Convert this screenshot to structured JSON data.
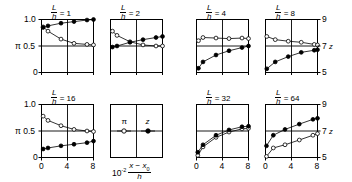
{
  "figure": {
    "axis": {
      "y_left_label": "π",
      "y_left_ticks": [
        "1.0",
        "0.5",
        "0"
      ],
      "y_right_label": "z",
      "y_right_ticks": [
        "9",
        "7",
        "5"
      ],
      "x_ticks": [
        "0",
        "4",
        "8"
      ],
      "x_label_prefix": "10",
      "x_label_exponent": "-2",
      "x_label_num": "x − x",
      "x_label_num_sub": "0",
      "x_label_den": "h"
    },
    "legend": {
      "title_ratio_num": "L",
      "title_ratio_den": "h",
      "entries": [
        {
          "symbol": "π",
          "marker": "open-circle"
        },
        {
          "symbol": "z",
          "marker": "filled-circle"
        }
      ]
    },
    "panels": [
      {
        "id": "panel-lh-1",
        "title_num": "L",
        "title_den": "h",
        "title_value": "1",
        "row": 0,
        "col": 0,
        "y_axis_side": "left",
        "series": [
          {
            "name": "π",
            "marker": "open-circle",
            "x": [
              0.25,
              1.0,
              3.0,
              5.0,
              7.0,
              8.0
            ],
            "y": [
              0.86,
              0.78,
              0.63,
              0.55,
              0.53,
              0.52
            ]
          },
          {
            "name": "z",
            "marker": "filled-circle",
            "x": [
              0.25,
              1.0,
              3.0,
              5.0,
              7.0,
              8.0
            ],
            "y": [
              0.85,
              0.88,
              0.93,
              0.96,
              0.99,
              1.0
            ]
          }
        ]
      },
      {
        "id": "panel-lh-2",
        "title_num": "L",
        "title_den": "h",
        "title_value": "2",
        "row": 0,
        "col": 1,
        "y_axis_side": "none",
        "series": [
          {
            "name": "π",
            "marker": "open-circle",
            "x": [
              0.3,
              1.0,
              3.0,
              5.0,
              7.0,
              8.0
            ],
            "y": [
              0.78,
              0.7,
              0.58,
              0.52,
              0.5,
              0.5
            ]
          },
          {
            "name": "z",
            "marker": "filled-circle",
            "x": [
              0.3,
              1.0,
              3.0,
              5.0,
              7.0,
              8.0
            ],
            "y": [
              0.48,
              0.5,
              0.57,
              0.62,
              0.66,
              0.68
            ]
          }
        ]
      },
      {
        "id": "panel-lh-4",
        "title_num": "L",
        "title_den": "h",
        "title_value": "4",
        "row": 0,
        "col": 2,
        "y_axis_side": "none",
        "series": [
          {
            "name": "π",
            "marker": "open-circle",
            "x": [
              0.3,
              1.0,
              3.0,
              5.0,
              7.0,
              8.0
            ],
            "y": [
              0.6,
              0.66,
              0.65,
              0.64,
              0.65,
              0.64
            ]
          },
          {
            "name": "z",
            "marker": "filled-circle",
            "x": [
              0.3,
              1.0,
              3.0,
              5.0,
              7.0,
              8.0
            ],
            "y": [
              0.08,
              0.2,
              0.33,
              0.41,
              0.47,
              0.5
            ]
          }
        ]
      },
      {
        "id": "panel-lh-8",
        "title_num": "L",
        "title_den": "h",
        "title_value": "8",
        "row": 0,
        "col": 3,
        "y_axis_side": "right",
        "series": [
          {
            "name": "π",
            "marker": "open-circle",
            "x": [
              0.2,
              1.5,
              3.5,
              5.5,
              7.5,
              8.0
            ],
            "y": [
              0.68,
              0.62,
              0.59,
              0.57,
              0.53,
              0.52
            ]
          },
          {
            "name": "z",
            "marker": "filled-circle",
            "x": [
              0.2,
              1.5,
              3.5,
              5.5,
              7.5,
              8.0
            ],
            "y": [
              0.07,
              0.2,
              0.3,
              0.38,
              0.42,
              0.43
            ]
          }
        ]
      },
      {
        "id": "panel-lh-16",
        "title_num": "L",
        "title_den": "h",
        "title_value": "16",
        "row": 1,
        "col": 0,
        "y_axis_side": "left",
        "series": [
          {
            "name": "π",
            "marker": "open-circle",
            "x": [
              0.25,
              1.0,
              3.0,
              5.0,
              7.0,
              8.0
            ],
            "y": [
              0.78,
              0.7,
              0.6,
              0.53,
              0.5,
              0.49
            ]
          },
          {
            "name": "z",
            "marker": "filled-circle",
            "x": [
              0.25,
              1.0,
              3.0,
              5.0,
              7.0,
              8.0
            ],
            "y": [
              0.16,
              0.18,
              0.22,
              0.25,
              0.28,
              0.31
            ]
          }
        ]
      },
      {
        "id": "panel-legend",
        "title_num": "",
        "title_den": "",
        "title_value": "",
        "row": 1,
        "col": 1,
        "y_axis_side": "none",
        "series": []
      },
      {
        "id": "panel-lh-32",
        "title_num": "L",
        "title_den": "h",
        "title_value": "32",
        "row": 1,
        "col": 2,
        "y_axis_side": "none",
        "series": [
          {
            "name": "π",
            "marker": "open-circle",
            "x": [
              0.2,
              1.0,
              3.0,
              5.0,
              7.0,
              8.0
            ],
            "y": [
              0.04,
              0.2,
              0.38,
              0.48,
              0.54,
              0.55
            ]
          },
          {
            "name": "z",
            "marker": "filled-circle",
            "x": [
              0.2,
              1.0,
              3.0,
              5.0,
              7.0,
              8.0
            ],
            "y": [
              0.1,
              0.24,
              0.42,
              0.52,
              0.58,
              0.59
            ]
          }
        ]
      },
      {
        "id": "panel-lh-64",
        "title_num": "L",
        "title_den": "h",
        "title_value": "64",
        "row": 1,
        "col": 3,
        "y_axis_side": "right",
        "series": [
          {
            "name": "π",
            "marker": "open-circle",
            "x": [
              0.15,
              1.2,
              3.0,
              5.2,
              7.3,
              8.0
            ],
            "y": [
              0.02,
              0.18,
              0.24,
              0.33,
              0.42,
              0.45
            ]
          },
          {
            "name": "z",
            "marker": "filled-circle",
            "x": [
              0.15,
              1.2,
              3.0,
              5.2,
              7.3,
              8.0
            ],
            "y": [
              0.22,
              0.42,
              0.53,
              0.63,
              0.72,
              0.74
            ]
          }
        ]
      }
    ]
  },
  "chart_data": {
    "type": "line",
    "title": "",
    "xlabel": "10^-2 (x - x0)/h",
    "ylabel_left": "π",
    "ylabel_right": "z",
    "xlim": [
      0,
      8
    ],
    "ylim_left": [
      0,
      1.0
    ],
    "ylim_right": [
      5,
      9
    ],
    "xticks": [
      0,
      4,
      8
    ],
    "yticks_left": [
      0,
      0.5,
      1.0
    ],
    "yticks_right": [
      5,
      7,
      9
    ],
    "grid": true,
    "legend": [
      "π",
      "z"
    ],
    "panels": [
      {
        "label": "L/h = 1",
        "series": [
          {
            "name": "π",
            "x": [
              0.25,
              1,
              3,
              5,
              7,
              8
            ],
            "y": [
              0.86,
              0.78,
              0.63,
              0.55,
              0.53,
              0.52
            ]
          },
          {
            "name": "z",
            "x": [
              0.25,
              1,
              3,
              5,
              7,
              8
            ],
            "y": [
              0.85,
              0.88,
              0.93,
              0.96,
              0.99,
              1.0
            ]
          }
        ]
      },
      {
        "label": "L/h = 2",
        "series": [
          {
            "name": "π",
            "x": [
              0.3,
              1,
              3,
              5,
              7,
              8
            ],
            "y": [
              0.78,
              0.7,
              0.58,
              0.52,
              0.5,
              0.5
            ]
          },
          {
            "name": "z",
            "x": [
              0.3,
              1,
              3,
              5,
              7,
              8
            ],
            "y": [
              0.48,
              0.5,
              0.57,
              0.62,
              0.66,
              0.68
            ]
          }
        ]
      },
      {
        "label": "L/h = 4",
        "series": [
          {
            "name": "π",
            "x": [
              0.3,
              1,
              3,
              5,
              7,
              8
            ],
            "y": [
              0.6,
              0.66,
              0.65,
              0.64,
              0.65,
              0.64
            ]
          },
          {
            "name": "z",
            "x": [
              0.3,
              1,
              3,
              5,
              7,
              8
            ],
            "y": [
              0.08,
              0.2,
              0.33,
              0.41,
              0.47,
              0.5
            ]
          }
        ]
      },
      {
        "label": "L/h = 8",
        "series": [
          {
            "name": "π",
            "x": [
              0.2,
              1.5,
              3.5,
              5.5,
              7.5,
              8
            ],
            "y": [
              0.68,
              0.62,
              0.59,
              0.57,
              0.53,
              0.52
            ]
          },
          {
            "name": "z",
            "x": [
              0.2,
              1.5,
              3.5,
              5.5,
              7.5,
              8
            ],
            "y": [
              0.07,
              0.2,
              0.3,
              0.38,
              0.42,
              0.43
            ]
          }
        ]
      },
      {
        "label": "L/h = 16",
        "series": [
          {
            "name": "π",
            "x": [
              0.25,
              1,
              3,
              5,
              7,
              8
            ],
            "y": [
              0.78,
              0.7,
              0.6,
              0.53,
              0.5,
              0.49
            ]
          },
          {
            "name": "z",
            "x": [
              0.25,
              1,
              3,
              5,
              7,
              8
            ],
            "y": [
              0.16,
              0.18,
              0.22,
              0.25,
              0.28,
              0.31
            ]
          }
        ]
      },
      {
        "label": "L/h = 32",
        "series": [
          {
            "name": "π",
            "x": [
              0.2,
              1,
              3,
              5,
              7,
              8
            ],
            "y": [
              0.04,
              0.2,
              0.38,
              0.48,
              0.54,
              0.55
            ]
          },
          {
            "name": "z",
            "x": [
              0.2,
              1,
              3,
              5,
              7,
              8
            ],
            "y": [
              0.1,
              0.24,
              0.42,
              0.52,
              0.58,
              0.59
            ]
          }
        ]
      },
      {
        "label": "L/h = 64",
        "series": [
          {
            "name": "π",
            "x": [
              0.15,
              1.2,
              3,
              5.2,
              7.3,
              8
            ],
            "y": [
              0.02,
              0.18,
              0.24,
              0.33,
              0.42,
              0.45
            ]
          },
          {
            "name": "z",
            "x": [
              0.15,
              1.2,
              3,
              5.2,
              7.3,
              8
            ],
            "y": [
              0.22,
              0.42,
              0.53,
              0.63,
              0.72,
              0.74
            ]
          }
        ]
      }
    ]
  }
}
